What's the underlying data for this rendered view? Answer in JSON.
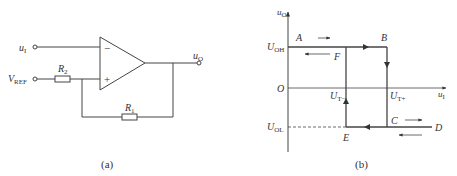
{
  "figure_a": {
    "caption": "(a)",
    "input_label": "u",
    "input_sub": "I",
    "ref_label": "V",
    "ref_sub": "REF",
    "output_label": "u",
    "output_sub": "O",
    "r2_label": "R",
    "r2_sub": "2",
    "r1_label": "R",
    "r1_sub": "1",
    "minus": "−",
    "plus": "+"
  },
  "figure_b": {
    "caption": "(b)",
    "y_axis_label": "u",
    "y_axis_sub": "O",
    "x_axis_label": "u",
    "x_axis_sub": "I",
    "origin": "O",
    "uoh_label": "U",
    "uoh_sub": "OH",
    "uol_label": "U",
    "uol_sub": "OL",
    "ut_minus_label": "U",
    "ut_minus_sub": "T−",
    "ut_plus_label": "U",
    "ut_plus_sub": "T+",
    "points": {
      "A": "A",
      "B": "B",
      "C": "C",
      "D": "D",
      "E": "E",
      "F": "F"
    }
  }
}
